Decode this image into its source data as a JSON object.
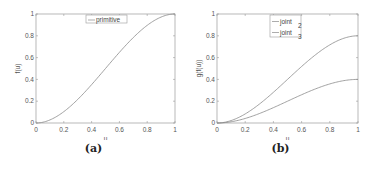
{
  "chart_data": [
    {
      "type": "line",
      "caption": "(a)",
      "title": "",
      "xlabel": "u",
      "ylabel": "f(u)",
      "xlim": [
        0,
        1
      ],
      "ylim": [
        0,
        1
      ],
      "xticks": [
        "0",
        "0.2",
        "0.4",
        "0.6",
        "0.8",
        "1"
      ],
      "yticks": [
        "0",
        "0.2",
        "0.4",
        "0.6",
        "0.8",
        "1"
      ],
      "grid": false,
      "legend_position": "top-center",
      "x": [
        0,
        0.1,
        0.2,
        0.3,
        0.4,
        0.5,
        0.6,
        0.7,
        0.8,
        0.9,
        1.0
      ],
      "series": [
        {
          "name": "primitive",
          "values": [
            0,
            0.028,
            0.104,
            0.216,
            0.352,
            0.5,
            0.648,
            0.784,
            0.896,
            0.972,
            1.0
          ]
        }
      ]
    },
    {
      "type": "line",
      "caption": "(b)",
      "title": "",
      "xlabel": "u",
      "ylabel": "g(f(u))",
      "xlim": [
        0,
        1
      ],
      "ylim": [
        0,
        1
      ],
      "xticks": [
        "0",
        "0.2",
        "0.4",
        "0.6",
        "0.8",
        "1"
      ],
      "yticks": [
        "0",
        "0.2",
        "0.4",
        "0.6",
        "0.8",
        "1"
      ],
      "grid": false,
      "legend_position": "top-center",
      "x": [
        0,
        0.1,
        0.2,
        0.3,
        0.4,
        0.5,
        0.6,
        0.7,
        0.8,
        0.9,
        1.0
      ],
      "series": [
        {
          "name": "joint 2",
          "name_main": "joint",
          "name_sub": "2",
          "values": [
            0,
            0.022,
            0.083,
            0.173,
            0.282,
            0.4,
            0.518,
            0.627,
            0.717,
            0.778,
            0.8
          ]
        },
        {
          "name": "joint 3",
          "name_main": "joint",
          "name_sub": "3",
          "values": [
            0,
            0.011,
            0.042,
            0.086,
            0.141,
            0.2,
            0.259,
            0.314,
            0.358,
            0.389,
            0.4
          ]
        }
      ]
    }
  ]
}
